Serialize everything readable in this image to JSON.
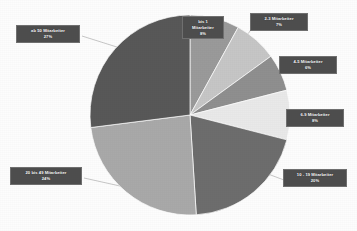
{
  "chart_data": {
    "type": "pie",
    "title": "",
    "subtitle": "",
    "xlabel": "",
    "ylabel": "",
    "legend_position": "none",
    "grid": false,
    "units": "percent",
    "start_angle_deg": 0,
    "direction": "clockwise",
    "categories": [
      "bis 1 Mitarbeiter",
      "2-3 Mitarbeiter",
      "4-5 Mitarbeiter",
      "6-9 Mitarbeiter",
      "10 - 19 Mitarbeiter",
      "20 bis 49 Mitarbeiter",
      "ab 50 Mitarbeiter"
    ],
    "values": [
      8,
      7,
      6,
      8,
      20,
      24,
      27
    ],
    "value_labels": [
      "8%",
      "7%",
      "6%",
      "8%",
      "20%",
      "24%",
      "27%"
    ],
    "colors": [
      "#9a9a9a",
      "#c6c6c6",
      "#8f8f8f",
      "#e9e9e9",
      "#6d6d6d",
      "#a9a9a9",
      "#585858"
    ],
    "total": 100
  },
  "chart": {
    "background_color": "#fdfdfd",
    "slice_outline_color": "#ffffff",
    "leader_line_color": "#b9b9b9",
    "callout_bg_color": "#4d4d4d",
    "callout_text_color": "#ffffff",
    "slices": [
      {
        "name": "slice-bis-1",
        "label": "bis 1",
        "label2": "Mitarbeiter",
        "pct": "8%",
        "value": 8,
        "color": "#9a9a9a"
      },
      {
        "name": "slice-2-3",
        "label": "2-3 Mitarbeiter",
        "pct": "7%",
        "value": 7,
        "color": "#c6c6c6"
      },
      {
        "name": "slice-4-5",
        "label": "4-5 Mitarbeiter",
        "pct": "6%",
        "value": 6,
        "color": "#8f8f8f"
      },
      {
        "name": "slice-6-9",
        "label": "6-9 Mitarbeiter",
        "pct": "8%",
        "value": 8,
        "color": "#e9e9e9"
      },
      {
        "name": "slice-10-19",
        "label": "10 - 19 Mitarbeiter",
        "pct": "20%",
        "value": 20,
        "color": "#6d6d6d"
      },
      {
        "name": "slice-20-49",
        "label": "20 bis 49 Mitarbeiter",
        "pct": "24%",
        "value": 24,
        "color": "#a9a9a9"
      },
      {
        "name": "slice-ab-50",
        "label": "ab 50 Mitarbeiter",
        "pct": "27%",
        "value": 27,
        "color": "#585858"
      }
    ]
  }
}
